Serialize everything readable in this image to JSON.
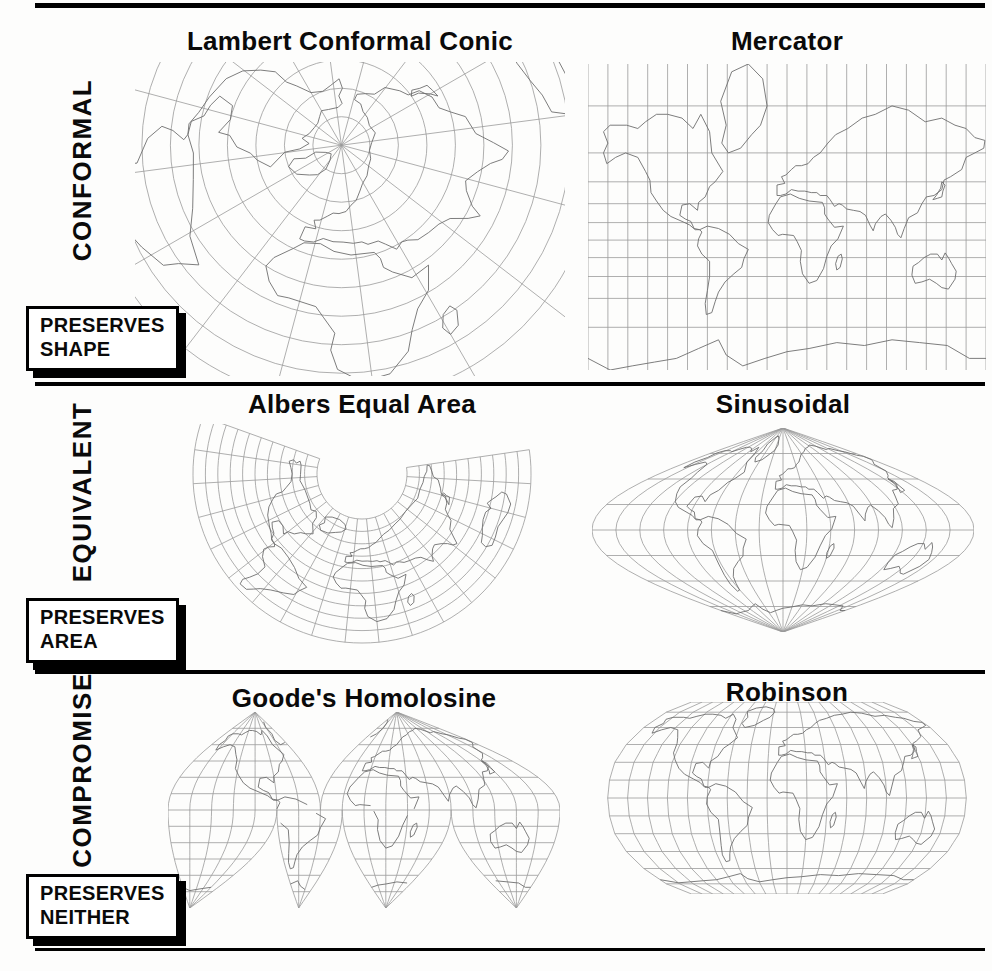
{
  "figure": {
    "rows": [
      {
        "category": "CONFORMAL",
        "preserves": [
          "PRESERVES",
          "SHAPE"
        ],
        "panels": [
          {
            "title": "Lambert Conformal Conic",
            "projection": "lambert"
          },
          {
            "title": "Mercator",
            "projection": "mercator"
          }
        ]
      },
      {
        "category": "EQUIVALENT",
        "preserves": [
          "PRESERVES",
          "AREA"
        ],
        "panels": [
          {
            "title": "Albers Equal Area",
            "projection": "albers"
          },
          {
            "title": "Sinusoidal",
            "projection": "sinusoidal"
          }
        ]
      },
      {
        "category": "COMPROMISE",
        "preserves": [
          "PRESERVES",
          "NEITHER"
        ],
        "panels": [
          {
            "title": "Goode's Homolosine",
            "projection": "goode"
          },
          {
            "title": "Robinson",
            "projection": "robinson"
          }
        ]
      }
    ],
    "colors": {
      "rule_bar": "#000000",
      "graticule": "#9b9b9b",
      "coastline": "#6e6e6e",
      "paper": "#fdfdfc"
    }
  },
  "world_outlines": {
    "north_america": [
      [
        -166,
        68
      ],
      [
        -160,
        70
      ],
      [
        -145,
        70
      ],
      [
        -135,
        69
      ],
      [
        -128,
        71
      ],
      [
        -118,
        73
      ],
      [
        -108,
        73
      ],
      [
        -95,
        72
      ],
      [
        -85,
        69
      ],
      [
        -78,
        73
      ],
      [
        -70,
        68
      ],
      [
        -68,
        60
      ],
      [
        -58,
        51
      ],
      [
        -65,
        45
      ],
      [
        -70,
        42
      ],
      [
        -74,
        35
      ],
      [
        -80,
        31
      ],
      [
        -81,
        25
      ],
      [
        -88,
        30
      ],
      [
        -95,
        29
      ],
      [
        -97,
        21
      ],
      [
        -92,
        18
      ],
      [
        -87,
        16
      ],
      [
        -84,
        10
      ],
      [
        -79,
        9
      ],
      [
        -83,
        9
      ],
      [
        -88,
        13
      ],
      [
        -95,
        16
      ],
      [
        -105,
        20
      ],
      [
        -112,
        25
      ],
      [
        -118,
        32
      ],
      [
        -123,
        38
      ],
      [
        -124,
        46
      ],
      [
        -128,
        51
      ],
      [
        -135,
        58
      ],
      [
        -146,
        60
      ],
      [
        -155,
        58
      ],
      [
        -163,
        55
      ],
      [
        -166,
        60
      ],
      [
        -162,
        64
      ],
      [
        -166,
        68
      ]
    ],
    "south_america": [
      [
        -79,
        9
      ],
      [
        -72,
        12
      ],
      [
        -62,
        10
      ],
      [
        -52,
        5
      ],
      [
        -44,
        -3
      ],
      [
        -35,
        -8
      ],
      [
        -39,
        -16
      ],
      [
        -41,
        -23
      ],
      [
        -48,
        -28
      ],
      [
        -56,
        -34
      ],
      [
        -62,
        -41
      ],
      [
        -65,
        -47
      ],
      [
        -68,
        -53
      ],
      [
        -73,
        -54
      ],
      [
        -74,
        -48
      ],
      [
        -72,
        -40
      ],
      [
        -70,
        -30
      ],
      [
        -70,
        -18
      ],
      [
        -77,
        -12
      ],
      [
        -81,
        -5
      ],
      [
        -80,
        1
      ],
      [
        -77,
        7
      ],
      [
        -79,
        9
      ]
    ],
    "greenland": [
      [
        -53,
        60
      ],
      [
        -59,
        64
      ],
      [
        -55,
        70
      ],
      [
        -60,
        76
      ],
      [
        -50,
        81
      ],
      [
        -35,
        83
      ],
      [
        -22,
        80
      ],
      [
        -18,
        75
      ],
      [
        -24,
        70
      ],
      [
        -32,
        67
      ],
      [
        -42,
        62
      ],
      [
        -53,
        60
      ]
    ],
    "africa": [
      [
        -6,
        35
      ],
      [
        3,
        37
      ],
      [
        11,
        34
      ],
      [
        20,
        32
      ],
      [
        32,
        31
      ],
      [
        34,
        27
      ],
      [
        34,
        22
      ],
      [
        37,
        18
      ],
      [
        43,
        11
      ],
      [
        51,
        12
      ],
      [
        46,
        1
      ],
      [
        40,
        -5
      ],
      [
        36,
        -14
      ],
      [
        33,
        -24
      ],
      [
        27,
        -33
      ],
      [
        20,
        -35
      ],
      [
        14,
        -28
      ],
      [
        12,
        -18
      ],
      [
        13,
        -9
      ],
      [
        9,
        -1
      ],
      [
        6,
        4
      ],
      [
        -4,
        5
      ],
      [
        -8,
        4
      ],
      [
        -13,
        9
      ],
      [
        -17,
        15
      ],
      [
        -16,
        21
      ],
      [
        -10,
        30
      ],
      [
        -6,
        35
      ]
    ],
    "eurasia": [
      [
        -9,
        36
      ],
      [
        -9,
        43
      ],
      [
        -2,
        44
      ],
      [
        -5,
        48
      ],
      [
        -1,
        49
      ],
      [
        4,
        52
      ],
      [
        8,
        54
      ],
      [
        13,
        54
      ],
      [
        19,
        55
      ],
      [
        24,
        58
      ],
      [
        30,
        60
      ],
      [
        37,
        64
      ],
      [
        44,
        67
      ],
      [
        55,
        69
      ],
      [
        68,
        72
      ],
      [
        80,
        73
      ],
      [
        95,
        75
      ],
      [
        110,
        74
      ],
      [
        125,
        71
      ],
      [
        140,
        72
      ],
      [
        152,
        70
      ],
      [
        162,
        69
      ],
      [
        170,
        66
      ],
      [
        179,
        65
      ],
      [
        178,
        62
      ],
      [
        170,
        60
      ],
      [
        162,
        58
      ],
      [
        158,
        52
      ],
      [
        148,
        48
      ],
      [
        142,
        46
      ],
      [
        140,
        40
      ],
      [
        133,
        36
      ],
      [
        126,
        35
      ],
      [
        122,
        30
      ],
      [
        118,
        23
      ],
      [
        110,
        19
      ],
      [
        106,
        10
      ],
      [
        103,
        2
      ],
      [
        100,
        5
      ],
      [
        98,
        11
      ],
      [
        94,
        17
      ],
      [
        89,
        22
      ],
      [
        85,
        20
      ],
      [
        80,
        14
      ],
      [
        78,
        8
      ],
      [
        75,
        13
      ],
      [
        71,
        21
      ],
      [
        66,
        24
      ],
      [
        60,
        25
      ],
      [
        54,
        26
      ],
      [
        50,
        29
      ],
      [
        47,
        30
      ],
      [
        43,
        28
      ],
      [
        39,
        33
      ],
      [
        36,
        36
      ],
      [
        30,
        36
      ],
      [
        27,
        38
      ],
      [
        22,
        38
      ],
      [
        16,
        39
      ],
      [
        10,
        39
      ],
      [
        4,
        40
      ],
      [
        -1,
        37
      ],
      [
        -6,
        36
      ],
      [
        -9,
        36
      ]
    ],
    "japan": [
      [
        140,
        45
      ],
      [
        143,
        43
      ],
      [
        141,
        39
      ],
      [
        140,
        35
      ],
      [
        136,
        34
      ],
      [
        132,
        33
      ],
      [
        135,
        36
      ],
      [
        139,
        41
      ],
      [
        140,
        45
      ]
    ],
    "madagascar": [
      [
        49,
        -12
      ],
      [
        50,
        -16
      ],
      [
        48,
        -23
      ],
      [
        45,
        -25
      ],
      [
        44,
        -20
      ],
      [
        46,
        -14
      ],
      [
        49,
        -12
      ]
    ],
    "australia": [
      [
        114,
        -22
      ],
      [
        119,
        -19
      ],
      [
        124,
        -15
      ],
      [
        130,
        -12
      ],
      [
        136,
        -12
      ],
      [
        140,
        -17
      ],
      [
        143,
        -11
      ],
      [
        146,
        -15
      ],
      [
        149,
        -20
      ],
      [
        153,
        -26
      ],
      [
        152,
        -32
      ],
      [
        146,
        -39
      ],
      [
        140,
        -38
      ],
      [
        135,
        -35
      ],
      [
        129,
        -32
      ],
      [
        122,
        -34
      ],
      [
        116,
        -35
      ],
      [
        113,
        -29
      ],
      [
        114,
        -22
      ]
    ],
    "antarctica": [
      [
        -180,
        -71
      ],
      [
        -160,
        -74
      ],
      [
        -140,
        -73
      ],
      [
        -120,
        -72
      ],
      [
        -100,
        -71
      ],
      [
        -80,
        -68
      ],
      [
        -62,
        -65
      ],
      [
        -55,
        -70
      ],
      [
        -40,
        -73
      ],
      [
        -20,
        -71
      ],
      [
        0,
        -69
      ],
      [
        20,
        -68
      ],
      [
        45,
        -66
      ],
      [
        70,
        -67
      ],
      [
        95,
        -65
      ],
      [
        120,
        -66
      ],
      [
        145,
        -67
      ],
      [
        165,
        -71
      ],
      [
        180,
        -71
      ]
    ]
  }
}
